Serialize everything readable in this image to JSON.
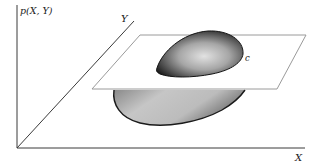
{
  "figure": {
    "type": "3d-surface-with-cutting-plane",
    "labels": {
      "z_axis": "p(X, Y)",
      "y_axis": "Y",
      "x_axis": "X",
      "contour": "c"
    },
    "colors": {
      "axis": "#3a3a3a",
      "plane_edge": "#9a9a9a",
      "surface_dark": "#1e1e1e",
      "surface_light": "#d8d8d8",
      "background": "#ffffff"
    }
  }
}
